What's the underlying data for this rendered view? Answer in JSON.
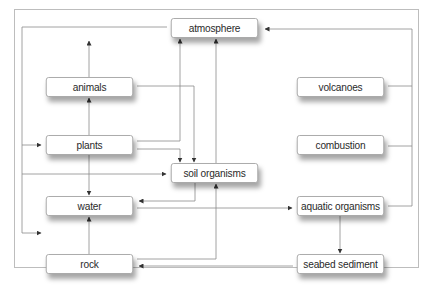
{
  "diagram": {
    "type": "flowchart",
    "nodes": {
      "atmosphere": "atmosphere",
      "animals": "animals",
      "plants": "plants",
      "soil_organisms": "soil organisms",
      "water": "water",
      "rock": "rock",
      "volcanoes": "volcanoes",
      "combustion": "combustion",
      "aquatic_organisms": "aquatic organisms",
      "seabed_sediment": "seabed sediment"
    },
    "edges": [
      {
        "from": "atmosphere",
        "to": "plants"
      },
      {
        "from": "atmosphere",
        "to": "water"
      },
      {
        "from": "plants",
        "to": "animals"
      },
      {
        "from": "animals",
        "to": "atmosphere"
      },
      {
        "from": "animals",
        "to": "soil organisms"
      },
      {
        "from": "plants",
        "to": "atmosphere"
      },
      {
        "from": "plants",
        "to": "soil organisms"
      },
      {
        "from": "plants",
        "to": "water"
      },
      {
        "from": "soil organisms",
        "to": "atmosphere"
      },
      {
        "from": "soil organisms",
        "to": "water"
      },
      {
        "from": "water",
        "to": "soil organisms"
      },
      {
        "from": "water",
        "to": "aquatic organisms"
      },
      {
        "from": "rock",
        "to": "water"
      },
      {
        "from": "rock",
        "to": "soil organisms"
      },
      {
        "from": "volcanoes",
        "to": "atmosphere"
      },
      {
        "from": "combustion",
        "to": "atmosphere"
      },
      {
        "from": "aquatic organisms",
        "to": "atmosphere"
      },
      {
        "from": "aquatic organisms",
        "to": "seabed sediment"
      },
      {
        "from": "seabed sediment",
        "to": "rock"
      },
      {
        "from": "animals",
        "to": "up-arrow"
      }
    ]
  }
}
